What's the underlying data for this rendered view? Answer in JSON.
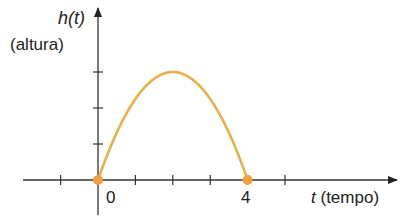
{
  "chart_data": {
    "type": "line",
    "title": "",
    "xlabel": "t (tempo)",
    "ylabel": "h(t) (altura)",
    "xlabel_var": "t",
    "xlabel_unit": "(tempo)",
    "ylabel_var": "h",
    "ylabel_arg": "(t)",
    "ylabel_unit": "(altura)",
    "x_tick_labels": [
      "0",
      "4"
    ],
    "x_ticks": [
      -1,
      0,
      1,
      2,
      3,
      4,
      5
    ],
    "y_ticks": [
      1,
      2,
      3
    ],
    "xlim": [
      -2,
      8
    ],
    "ylim": [
      -1,
      5
    ],
    "grid": false,
    "series": [
      {
        "name": "h(t)",
        "color": "#E8B04A",
        "x": [
          0,
          0.5,
          1,
          1.5,
          2,
          2.5,
          3,
          3.5,
          4
        ],
        "y": [
          0,
          1.31,
          2.25,
          2.81,
          3,
          2.81,
          2.25,
          1.31,
          0
        ]
      }
    ],
    "points": [
      {
        "x": 0,
        "y": 0,
        "color": "#F0A040"
      },
      {
        "x": 4,
        "y": 0,
        "color": "#F0A040"
      }
    ]
  }
}
